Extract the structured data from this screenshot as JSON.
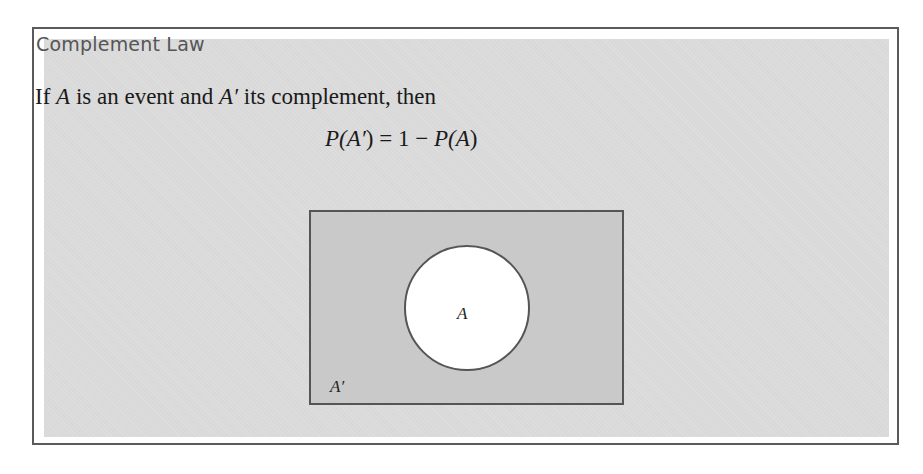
{
  "box": {
    "title": "Complement Law",
    "statement": {
      "parts": [
        "If ",
        "A",
        " is an event and ",
        "A′",
        " its complement, then"
      ]
    },
    "formula": {
      "lhs_p": "P(",
      "lhs_var": "A′",
      "lhs_close": ")",
      "equals": " = 1 − ",
      "rhs_p": "P(",
      "rhs_var": "A",
      "rhs_close": ")"
    },
    "diagram": {
      "set_label": "A",
      "complement_label": "A′",
      "colors": {
        "universe_fill": "#c9c9c9",
        "set_fill": "#ffffff",
        "stroke": "#555555"
      }
    }
  }
}
